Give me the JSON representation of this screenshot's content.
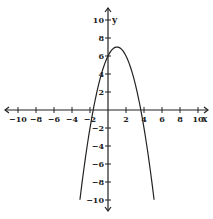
{
  "chart_data": {
    "type": "line",
    "title": "",
    "xlabel": "x",
    "ylabel": "y",
    "xlim": [
      -10,
      10
    ],
    "ylim": [
      -10,
      10
    ],
    "grid": false,
    "x_ticks": [
      -10,
      -8,
      -6,
      -4,
      -2,
      2,
      4,
      6,
      8,
      10
    ],
    "y_ticks": [
      -10,
      -8,
      -6,
      -4,
      -2,
      2,
      4,
      6,
      8,
      10
    ],
    "series": [
      {
        "name": "parabola",
        "equation": "y = -(x - 1)^2 + 7",
        "vertex": [
          1,
          7
        ],
        "y_intercept": 6,
        "x_intercepts": [
          -1.65,
          3.65
        ],
        "x": [
          -3.12,
          -3,
          -2,
          -1,
          0,
          1,
          2,
          3,
          4,
          5,
          5.12
        ],
        "values": [
          -10,
          -9,
          -2,
          3,
          6,
          7,
          6,
          3,
          -2,
          -9,
          -10
        ]
      }
    ]
  },
  "colors": {
    "axis": "#222222",
    "curve": "#222222",
    "background": "#ffffff"
  }
}
